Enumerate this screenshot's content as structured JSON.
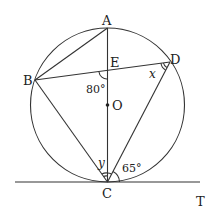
{
  "diagram": {
    "type": "circle-geometry",
    "circle": {
      "center_label": "O"
    },
    "points": {
      "A": "A",
      "B": "B",
      "C": "C",
      "D": "D",
      "E": "E",
      "O": "O",
      "T": "T"
    },
    "angles": {
      "angle_BEC": "80°",
      "angle_BDC": "x",
      "angle_BCA": "y",
      "angle_DCT": "65°"
    },
    "segments": [
      "AB",
      "AC",
      "BD",
      "BC",
      "CD"
    ],
    "tangent": {
      "label": "CT",
      "at_point": "C"
    },
    "colors": {
      "stroke": "#333333",
      "background": "#ffffff"
    }
  }
}
